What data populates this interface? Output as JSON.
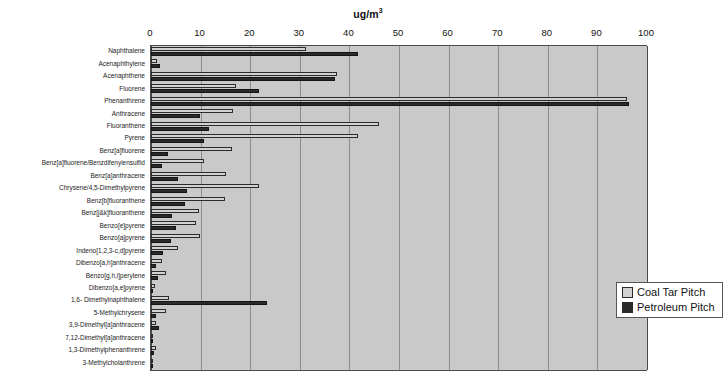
{
  "chart_data": {
    "type": "bar",
    "orientation": "horizontal",
    "title": "ug/m3",
    "title_base": "ug/m",
    "title_exponent": "3",
    "xlabel": "",
    "ylabel": "",
    "xlim": [
      0,
      100
    ],
    "xticks": [
      0,
      10,
      20,
      30,
      40,
      50,
      60,
      70,
      80,
      90,
      100
    ],
    "xtick_labels": [
      "0",
      "10",
      "20",
      "30",
      "40",
      "50",
      "60",
      "70",
      "80",
      "90",
      "100"
    ],
    "grid": true,
    "grid_axis": "x",
    "legend_position": "center-right-inside",
    "plot_background": "#c9c9c9",
    "categories": [
      "Naphthalene",
      "Acenaphthylene",
      "Acenaphthene",
      "Fluorene",
      "Phenanthrene",
      "Anthracene",
      "Fluoranthene",
      "Pyrene",
      "Benz[a]fluorene",
      "Benz[a]fluorene/Benzdifenylensulfid",
      "Benz[a]anthracene",
      "Chrysene/4,5-Dimethylpyrene",
      "Benz[b]fluoranthene",
      "Benz[j&k]fluoranthene",
      "Benzo[e]pyrene",
      "Benzo[a]pyrene",
      "Indeno[1,2,3-c,d]pyrene",
      "Dibenzo[a,h]anthracene",
      "Benzo[g,h,i]perylene",
      "Dibenzo[a,e]pyrene",
      "1,6- Dimethylnaphthalene",
      "5-Methylchrysene",
      "3,9-Dimethyl[a]anthracene",
      "7,12-Dimethyl[a]anthracene",
      "1,3-Dimethylphenanthrene",
      "3-Methylcholanthrene"
    ],
    "series": [
      {
        "name": "Coal Tar Pitch",
        "color": "#d2d2d2",
        "values": [
          31.3,
          1.3,
          37.5,
          17.2,
          96.0,
          16.6,
          45.9,
          41.8,
          16.3,
          10.6,
          15.1,
          21.8,
          14.9,
          9.6,
          9.1,
          9.9,
          5.4,
          2.2,
          3.1,
          0.9,
          3.6,
          3.0,
          1.0,
          0.5,
          1.0,
          0.3
        ]
      },
      {
        "name": "Petroleum Pitch",
        "color": "#2a2a2a",
        "values": [
          41.8,
          1.9,
          37.1,
          21.8,
          96.3,
          9.9,
          11.6,
          10.7,
          3.4,
          2.3,
          5.4,
          7.3,
          6.9,
          4.2,
          5.0,
          4.1,
          2.4,
          1.1,
          1.5,
          0.5,
          23.4,
          1.1,
          1.6,
          0.4,
          0.6,
          0.4
        ]
      }
    ]
  },
  "legend": {
    "items": [
      {
        "label": "Coal Tar Pitch",
        "swatch": "coal"
      },
      {
        "label": "Petroleum Pitch",
        "swatch": "petro"
      }
    ]
  }
}
